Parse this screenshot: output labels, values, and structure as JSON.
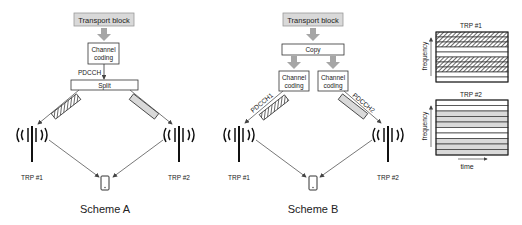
{
  "scheme_a": {
    "caption": "Scheme A",
    "transport_block": "Transport block",
    "channel_coding_line1": "Channel",
    "channel_coding_line2": "coding",
    "pdcch_label": "PDCCH",
    "split_label": "Split",
    "trp1_label": "TRP #1",
    "trp2_label": "TRP #2"
  },
  "scheme_b": {
    "caption": "Scheme B",
    "transport_block": "Transport block",
    "copy_label": "Copy",
    "channel_coding_line1": "Channel",
    "channel_coding_line2": "coding",
    "pdcch1_label": "PDCCH1",
    "pdcch2_label": "PDCCH2",
    "trp1_label": "TRP #1",
    "trp2_label": "TRP #2"
  },
  "resource_grids": {
    "trp1": {
      "title": "TRP #1",
      "y_axis": "frequency",
      "rows": [
        "hatched",
        "hatched",
        "empty",
        "empty",
        "hatched",
        "hatched",
        "empty",
        "empty"
      ]
    },
    "trp2": {
      "title": "TRP #2",
      "y_axis": "frequency",
      "x_axis": "time",
      "rows": [
        "empty",
        "empty",
        "gray",
        "gray",
        "empty",
        "empty",
        "gray",
        "gray"
      ]
    }
  },
  "colors": {
    "box_gray": "#d9d9d9",
    "arrow_gray": "#a6a6a6",
    "line": "#333333",
    "hatch": "#555555"
  }
}
